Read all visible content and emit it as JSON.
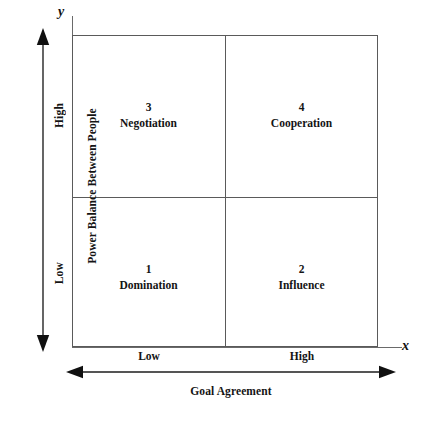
{
  "diagram": {
    "type": "2x2-quadrant-matrix",
    "axes": {
      "y": {
        "letter": "y",
        "title": "Power Balance Between People",
        "categories": [
          "Low",
          "High"
        ],
        "low_label": "Low",
        "high_label": "High",
        "arrow": "double-headed-vertical"
      },
      "x": {
        "letter": "x",
        "title": "Goal Agreement",
        "categories": [
          "Low",
          "High"
        ],
        "low_label": "Low",
        "high_label": "High",
        "arrow": "double-headed-horizontal"
      }
    },
    "quadrants": [
      {
        "number": "1",
        "label": "Domination",
        "position": "bottom-left",
        "goal_agreement": "Low",
        "power_balance": "Low"
      },
      {
        "number": "2",
        "label": "Influence",
        "position": "bottom-right",
        "goal_agreement": "High",
        "power_balance": "Low"
      },
      {
        "number": "3",
        "label": "Negotiation",
        "position": "top-left",
        "goal_agreement": "Low",
        "power_balance": "High"
      },
      {
        "number": "4",
        "label": "Cooperation",
        "position": "top-right",
        "goal_agreement": "High",
        "power_balance": "High"
      }
    ],
    "colors": {
      "background": "#ffffff",
      "frame_line": "#5a5a5a",
      "axis_line": "#6a6a6a",
      "text": "#141414",
      "arrow": "#1a1a1a"
    }
  }
}
